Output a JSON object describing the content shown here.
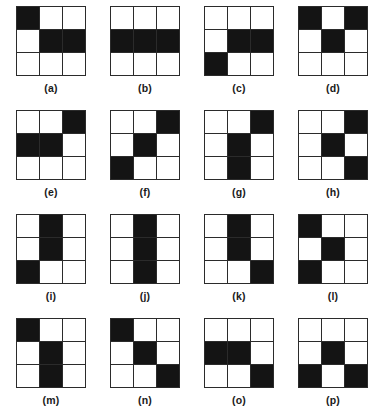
{
  "figure": {
    "type": "binary-matrix-panel-figure",
    "grid_size": 3,
    "panel_columns": 4,
    "panel_rows": 4,
    "colors": {
      "filled": "#141414",
      "empty": "#ffffff",
      "line": "#2b2b2b",
      "caption": "#1a1a1a"
    },
    "rows": [
      {
        "panels": [
          {
            "caption": "(a)",
            "letter": "a",
            "cells": [
              1,
              0,
              0,
              0,
              1,
              1,
              0,
              0,
              0
            ],
            "filled_indices": [
              0,
              4,
              5
            ],
            "filled_count": 3,
            "description": "top-left, center, middle-right"
          },
          {
            "caption": "(b)",
            "letter": "b",
            "cells": [
              0,
              0,
              0,
              1,
              1,
              1,
              0,
              0,
              0
            ],
            "filled_indices": [
              3,
              4,
              5
            ],
            "filled_count": 3,
            "description": "entire middle row"
          },
          {
            "caption": "(c)",
            "letter": "c",
            "cells": [
              0,
              0,
              0,
              0,
              1,
              1,
              1,
              0,
              0
            ],
            "filled_indices": [
              4,
              5,
              6
            ],
            "filled_count": 3,
            "description": "center, middle-right, bottom-left"
          },
          {
            "caption": "(d)",
            "letter": "d",
            "cells": [
              1,
              0,
              1,
              0,
              1,
              0,
              0,
              0,
              0
            ],
            "filled_indices": [
              0,
              2,
              4
            ],
            "filled_count": 3,
            "description": "top-left, top-right, center"
          }
        ]
      },
      {
        "panels": [
          {
            "caption": "(e)",
            "letter": "e",
            "cells": [
              0,
              0,
              1,
              1,
              1,
              0,
              0,
              0,
              0
            ],
            "filled_indices": [
              2,
              3,
              4
            ],
            "filled_count": 3,
            "description": "top-right, middle-left, center"
          },
          {
            "caption": "(f)",
            "letter": "f",
            "cells": [
              0,
              0,
              1,
              0,
              1,
              0,
              1,
              0,
              0
            ],
            "filled_indices": [
              2,
              4,
              6
            ],
            "filled_count": 3,
            "description": "anti-diagonal"
          },
          {
            "caption": "(g)",
            "letter": "g",
            "cells": [
              0,
              0,
              1,
              0,
              1,
              0,
              0,
              1,
              0
            ],
            "filled_indices": [
              2,
              4,
              7
            ],
            "filled_count": 3,
            "description": "top-right, center, bottom-center"
          },
          {
            "caption": "(h)",
            "letter": "h",
            "cells": [
              0,
              0,
              1,
              0,
              1,
              0,
              0,
              0,
              1
            ],
            "filled_indices": [
              2,
              4,
              8
            ],
            "filled_count": 3,
            "description": "top-right, center, bottom-right"
          }
        ]
      },
      {
        "panels": [
          {
            "caption": "(i)",
            "letter": "i",
            "cells": [
              0,
              1,
              0,
              0,
              1,
              0,
              1,
              0,
              0
            ],
            "filled_indices": [
              1,
              4,
              6
            ],
            "filled_count": 3,
            "description": "top-center, center, bottom-left"
          },
          {
            "caption": "(j)",
            "letter": "j",
            "cells": [
              0,
              1,
              0,
              0,
              1,
              0,
              0,
              1,
              0
            ],
            "filled_indices": [
              1,
              4,
              7
            ],
            "filled_count": 3,
            "description": "entire middle column"
          },
          {
            "caption": "(k)",
            "letter": "k",
            "cells": [
              0,
              1,
              0,
              0,
              1,
              0,
              0,
              0,
              1
            ],
            "filled_indices": [
              1,
              4,
              8
            ],
            "filled_count": 3,
            "description": "top-center, center, bottom-right"
          },
          {
            "caption": "(l)",
            "letter": "l",
            "cells": [
              1,
              0,
              0,
              0,
              1,
              0,
              1,
              0,
              0
            ],
            "filled_indices": [
              0,
              4,
              6
            ],
            "filled_count": 3,
            "description": "top-left, center, bottom-left"
          }
        ]
      },
      {
        "panels": [
          {
            "caption": "(m)",
            "letter": "m",
            "cells": [
              1,
              0,
              0,
              0,
              1,
              0,
              0,
              1,
              0
            ],
            "filled_indices": [
              0,
              4,
              7
            ],
            "filled_count": 3,
            "description": "top-left, center, bottom-center"
          },
          {
            "caption": "(n)",
            "letter": "n",
            "cells": [
              1,
              0,
              0,
              0,
              1,
              0,
              0,
              0,
              1
            ],
            "filled_indices": [
              0,
              4,
              8
            ],
            "filled_count": 3,
            "description": "main diagonal"
          },
          {
            "caption": "(o)",
            "letter": "o",
            "cells": [
              0,
              0,
              0,
              1,
              1,
              0,
              0,
              0,
              1
            ],
            "filled_indices": [
              3,
              4,
              8
            ],
            "filled_count": 3,
            "description": "middle-left, center, bottom-right"
          },
          {
            "caption": "(p)",
            "letter": "p",
            "cells": [
              0,
              0,
              0,
              0,
              1,
              0,
              1,
              0,
              1
            ],
            "filled_indices": [
              4,
              6,
              8
            ],
            "filled_count": 3,
            "description": "center, bottom-left, bottom-right"
          }
        ]
      }
    ]
  }
}
